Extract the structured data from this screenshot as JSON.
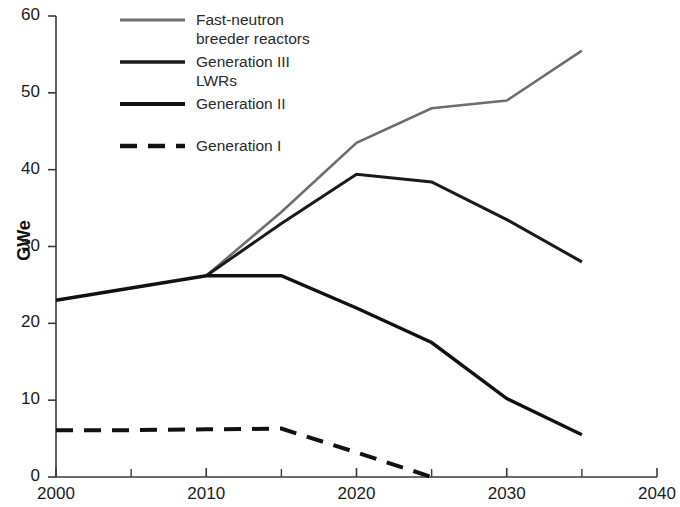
{
  "chart_data": {
    "type": "line",
    "title": "",
    "xlabel": "",
    "ylabel": "GWe",
    "xlim": [
      2000,
      2040
    ],
    "ylim": [
      0,
      60
    ],
    "x_ticks": [
      2000,
      2010,
      2020,
      2030,
      2040
    ],
    "x_minor_ticks": [
      2005,
      2015,
      2025,
      2035
    ],
    "y_ticks": [
      0,
      10,
      20,
      30,
      40,
      50,
      60
    ],
    "grid": false,
    "legend_position": "top-left-inside",
    "series": [
      {
        "name": "Fast-neutron breeder reactors",
        "color": "#6e6e6e",
        "style": "solid",
        "width": 2.6,
        "x": [
          2010,
          2015,
          2020,
          2025,
          2030,
          2035
        ],
        "values": [
          26.2,
          34.5,
          43.5,
          48.0,
          49.0,
          55.5
        ]
      },
      {
        "name": "Generation III LWRs",
        "color": "#1a1a1a",
        "style": "solid",
        "width": 3.0,
        "x": [
          2010,
          2015,
          2020,
          2025,
          2030,
          2035
        ],
        "values": [
          26.2,
          33.0,
          39.4,
          38.4,
          33.5,
          28.0
        ]
      },
      {
        "name": "Generation II",
        "color": "#111111",
        "style": "solid",
        "width": 3.4,
        "x": [
          2000,
          2005,
          2010,
          2015,
          2020,
          2025,
          2030,
          2035
        ],
        "values": [
          23.0,
          24.6,
          26.2,
          26.2,
          22.0,
          17.5,
          10.2,
          5.5
        ]
      },
      {
        "name": "Generation I",
        "color": "#111111",
        "style": "dashed",
        "width": 4.0,
        "x": [
          2000,
          2005,
          2010,
          2015,
          2020,
          2025
        ],
        "values": [
          6.1,
          6.1,
          6.2,
          6.3,
          3.2,
          0.0
        ]
      }
    ]
  },
  "axis": {
    "y_title": "GWe",
    "y_tick_labels": [
      "60",
      "50",
      "40",
      "30",
      "20",
      "10",
      "0"
    ],
    "x_tick_labels": [
      "2000",
      "2010",
      "2020",
      "2030",
      "2040"
    ]
  },
  "legend": {
    "entries": [
      {
        "label": "Fast-neutron\nbreeder reactors",
        "color": "#6e6e6e",
        "style": "solid"
      },
      {
        "label": "Generation III\nLWRs",
        "color": "#1a1a1a",
        "style": "solid"
      },
      {
        "label": "Generation II",
        "color": "#111111",
        "style": "solid"
      },
      {
        "label": "Generation I",
        "color": "#111111",
        "style": "dashed"
      }
    ]
  }
}
